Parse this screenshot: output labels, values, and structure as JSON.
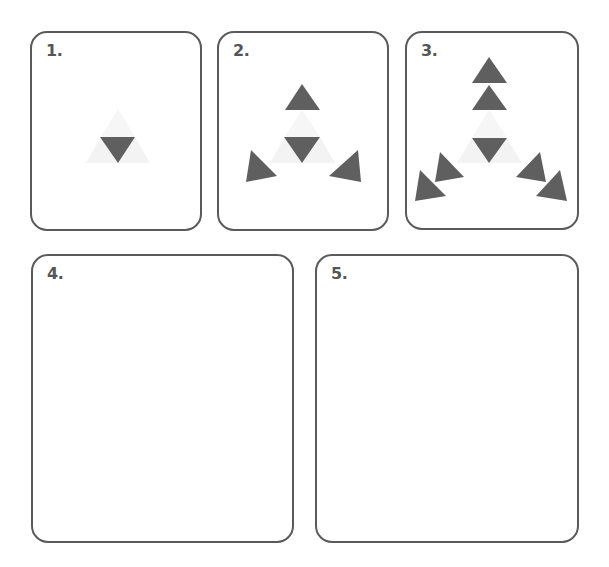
{
  "colors": {
    "border": "#5a5a5a",
    "label": "#555555",
    "triangle_dark": "#5f5f5f",
    "triangle_faint": "#f3f3f3"
  },
  "panels": [
    {
      "label": "1.",
      "state": "central inverted triangle only"
    },
    {
      "label": "2.",
      "state": "central triangle plus three outward triangles"
    },
    {
      "label": "3.",
      "state": "central triangle plus two outward triangles on each of three arms"
    },
    {
      "label": "4.",
      "state": "empty"
    },
    {
      "label": "5.",
      "state": "empty"
    }
  ]
}
